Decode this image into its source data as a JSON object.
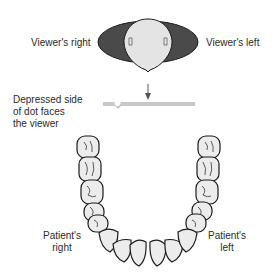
{
  "labels": {
    "viewers_right": "Viewer's right",
    "viewers_left": "Viewer's left",
    "depressed_line1": "Depressed side",
    "depressed_line2": "of dot faces",
    "depressed_line3": "the viewer",
    "patients_right_line1": "Patient's",
    "patients_right_line2": "right",
    "patients_left_line1": "Patient's",
    "patients_left_line2": "left"
  },
  "colors": {
    "ellipse_dark": "#4a4a4a",
    "dot_light": "#e4e4e4",
    "bar": "#c8c8c8",
    "tooth_fill": "#ececec",
    "outline": "#1a1a1a",
    "text": "#2b2b2b"
  }
}
